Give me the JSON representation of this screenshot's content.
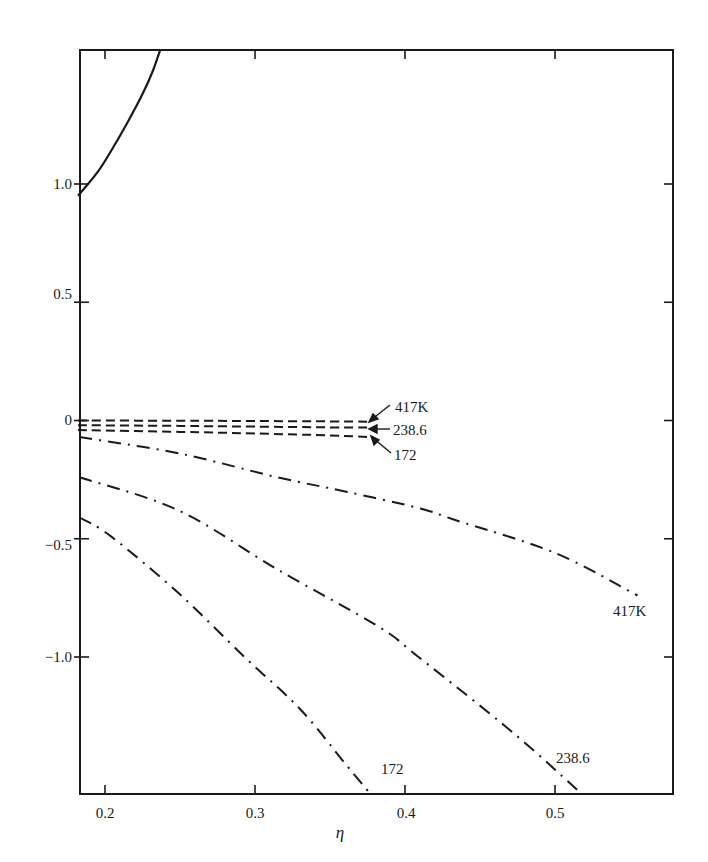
{
  "chart_data": {
    "type": "line",
    "title": "",
    "xlabel": "η",
    "ylabel": "",
    "xlim": [
      0.182,
      0.578
    ],
    "ylim": [
      -1.58,
      1.57
    ],
    "grid": false,
    "legend": "none (curves labeled inline)",
    "x_ticks": [
      0.2,
      0.3,
      0.4,
      0.5
    ],
    "x_tick_labels": [
      "0.2",
      "0.3",
      "0.4",
      "0.5"
    ],
    "y_ticks": [
      1.0,
      0.5,
      0,
      -0.5,
      -1.0
    ],
    "y_tick_labels": [
      "1.0",
      "0.5",
      "0",
      "−0.5",
      "−1.0"
    ],
    "series": [
      {
        "name": "solid",
        "style": "solid",
        "label": "",
        "x": [
          0.182,
          0.195,
          0.205,
          0.215,
          0.225,
          0.232,
          0.237
        ],
        "y": [
          0.95,
          1.05,
          1.15,
          1.26,
          1.38,
          1.48,
          1.57
        ]
      },
      {
        "name": "417K dashed",
        "style": "dashed",
        "label": "417K",
        "x": [
          0.182,
          0.25,
          0.3,
          0.35,
          0.375
        ],
        "y": [
          0.0,
          -0.001,
          -0.002,
          -0.004,
          -0.005
        ]
      },
      {
        "name": "238.6 dashed",
        "style": "dashed",
        "label": "238.6",
        "x": [
          0.182,
          0.25,
          0.3,
          0.35,
          0.375
        ],
        "y": [
          -0.02,
          -0.023,
          -0.026,
          -0.029,
          -0.03
        ]
      },
      {
        "name": "172 dashed",
        "style": "dashed",
        "label": "172",
        "x": [
          0.182,
          0.25,
          0.3,
          0.35,
          0.375
        ],
        "y": [
          -0.04,
          -0.048,
          -0.055,
          -0.063,
          -0.07
        ]
      },
      {
        "name": "417K dash-dot",
        "style": "dashdot",
        "label": "417K",
        "x": [
          0.183,
          0.25,
          0.315,
          0.36,
          0.409,
          0.433,
          0.5,
          0.555
        ],
        "y": [
          -0.07,
          -0.14,
          -0.24,
          -0.3,
          -0.37,
          -0.42,
          -0.56,
          -0.74
        ]
      },
      {
        "name": "238.6 dash-dot",
        "style": "dashdot",
        "label": "238.6",
        "x": [
          0.183,
          0.249,
          0.315,
          0.382,
          0.409,
          0.472,
          0.518
        ],
        "y": [
          -0.24,
          -0.38,
          -0.63,
          -0.87,
          -1.0,
          -1.32,
          -1.58
        ]
      },
      {
        "name": "172 dash-dot",
        "style": "dashdot",
        "label": "172",
        "x": [
          0.183,
          0.204,
          0.249,
          0.293,
          0.33,
          0.36,
          0.377
        ],
        "y": [
          -0.41,
          -0.49,
          -0.73,
          -1.0,
          -1.22,
          -1.45,
          -1.58
        ]
      }
    ],
    "annotations": [
      {
        "text": "417K",
        "target": "417K dashed",
        "arrow": true
      },
      {
        "text": "238.6",
        "target": "238.6 dashed",
        "arrow": true
      },
      {
        "text": "172",
        "target": "172 dashed",
        "arrow": true
      },
      {
        "text": "417K",
        "target": "417K dash-dot",
        "arrow": false
      },
      {
        "text": "238.6",
        "target": "238.6 dash-dot",
        "arrow": false
      },
      {
        "text": "172",
        "target": "172 dash-dot",
        "arrow": false
      }
    ]
  },
  "labels": {
    "x_axis_title": "η",
    "x_ticks": [
      "0.2",
      "0.3",
      "0.4",
      "0.5"
    ],
    "y_ticks": [
      "1.0",
      "0.5",
      "0",
      "−0.5",
      "−1.0"
    ],
    "dashed_417": "417K",
    "dashed_238": "238.6",
    "dashed_172": "172",
    "dashdot_417": "417K",
    "dashdot_238": "238.6",
    "dashdot_172": "172"
  }
}
